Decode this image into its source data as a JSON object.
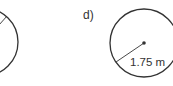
{
  "figures": [
    {
      "id": "c",
      "label": "",
      "partial": true
    },
    {
      "id": "d",
      "label": "d)",
      "radius_label": "1.75 m"
    }
  ],
  "colors": {
    "stroke": "#333333",
    "background": "#ffffff"
  }
}
